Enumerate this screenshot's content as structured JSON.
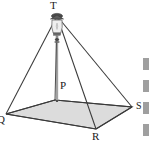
{
  "figure": {
    "type": "geometry-diagram",
    "background_color": "#ffffff",
    "line_color": "#3a3a3a",
    "base_fill_color": "#dcdcdc",
    "pole_color": "#b4b4b4",
    "labels": {
      "apex": "T",
      "center": "P",
      "front_vertex": "R",
      "right_vertex": "S",
      "left_vertex": "Q"
    },
    "vertices": {
      "apex": {
        "x": 57,
        "y": 14
      },
      "center": {
        "x": 57,
        "y": 101
      },
      "back": {
        "x": 55,
        "y": 100
      },
      "left": {
        "x": 6,
        "y": 114
      },
      "right": {
        "x": 132,
        "y": 107
      },
      "front": {
        "x": 96,
        "y": 129
      }
    },
    "lamp": {
      "name": "hanging-lantern",
      "cap_color": "#5a5a5a",
      "glass_color": "#efefef",
      "x": 57,
      "y": 26
    },
    "margin_fragments": [
      {
        "top": 58,
        "height": 12
      },
      {
        "top": 80,
        "height": 12
      },
      {
        "top": 102,
        "height": 12
      },
      {
        "top": 124,
        "height": 12
      }
    ]
  }
}
